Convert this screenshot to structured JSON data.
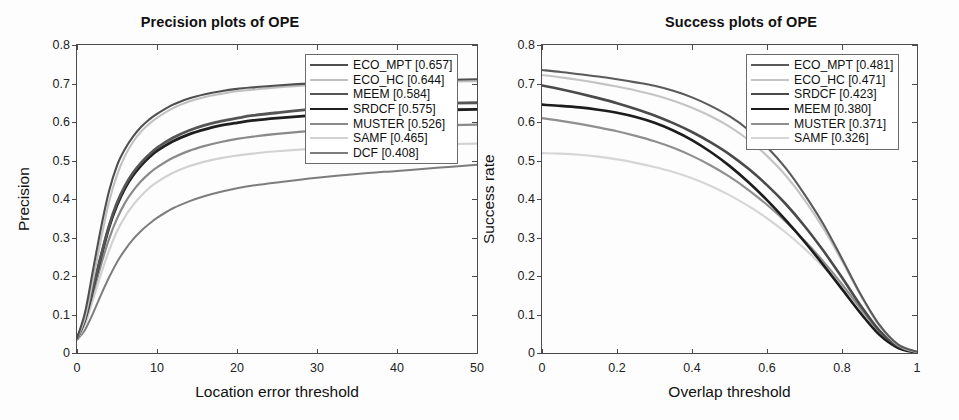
{
  "figure": {
    "background": "#fdfdfd",
    "panels": [
      "precision",
      "success"
    ]
  },
  "chart_data": [
    {
      "id": "precision",
      "type": "line",
      "title": "Precision plots of OPE",
      "xlabel": "Location error threshold",
      "ylabel": "Precision",
      "xlim": [
        0,
        50
      ],
      "ylim": [
        0,
        0.8
      ],
      "xticks": [
        0,
        10,
        20,
        30,
        40,
        50
      ],
      "xticklabels": [
        "0",
        "10",
        "20",
        "30",
        "40",
        "50"
      ],
      "yticks": [
        0,
        0.1,
        0.2,
        0.3,
        0.4,
        0.5,
        0.6,
        0.7,
        0.8
      ],
      "yticklabels": [
        "0",
        "0.1",
        "0.2",
        "0.3",
        "0.4",
        "0.5",
        "0.6",
        "0.7",
        "0.8"
      ],
      "grid": false,
      "legend_position": "upper right",
      "x": [
        0,
        1,
        2,
        3,
        4,
        5,
        6,
        7,
        8,
        9,
        10,
        12,
        14,
        16,
        18,
        20,
        22,
        25,
        30,
        35,
        40,
        45,
        50
      ],
      "series": [
        {
          "name": "ECO_MPT",
          "score": 0.657,
          "label": "ECO_MPT [0.657]",
          "color": "#4f4f4f",
          "width": 2.1,
          "values": [
            0.038,
            0.105,
            0.215,
            0.325,
            0.42,
            0.487,
            0.53,
            0.562,
            0.587,
            0.606,
            0.621,
            0.645,
            0.661,
            0.672,
            0.68,
            0.686,
            0.69,
            0.695,
            0.701,
            0.705,
            0.707,
            0.709,
            0.711
          ]
        },
        {
          "name": "ECO_HC",
          "score": 0.644,
          "label": "ECO_HC [0.644]",
          "color": "#c0c0c0",
          "width": 2.1,
          "values": [
            0.036,
            0.092,
            0.19,
            0.296,
            0.392,
            0.462,
            0.512,
            0.548,
            0.575,
            0.595,
            0.611,
            0.636,
            0.653,
            0.665,
            0.673,
            0.68,
            0.684,
            0.69,
            0.696,
            0.7,
            0.703,
            0.705,
            0.706
          ]
        },
        {
          "name": "MEEM",
          "score": 0.584,
          "label": "MEEM [0.584]",
          "color": "#555555",
          "width": 2.8,
          "values": [
            0.038,
            0.09,
            0.17,
            0.253,
            0.33,
            0.39,
            0.434,
            0.468,
            0.494,
            0.515,
            0.533,
            0.559,
            0.578,
            0.592,
            0.602,
            0.61,
            0.617,
            0.624,
            0.634,
            0.641,
            0.645,
            0.648,
            0.65
          ]
        },
        {
          "name": "SRDCF",
          "score": 0.575,
          "label": "SRDCF [0.575]",
          "color": "#1f1f1f",
          "width": 2.8,
          "values": [
            0.037,
            0.088,
            0.168,
            0.25,
            0.326,
            0.384,
            0.428,
            0.461,
            0.487,
            0.508,
            0.525,
            0.55,
            0.568,
            0.581,
            0.591,
            0.598,
            0.604,
            0.61,
            0.618,
            0.624,
            0.628,
            0.631,
            0.633
          ]
        },
        {
          "name": "MUSTER",
          "score": 0.526,
          "label": "MUSTER [0.526]",
          "color": "#8a8a8a",
          "width": 2.2,
          "values": [
            0.037,
            0.082,
            0.155,
            0.229,
            0.296,
            0.349,
            0.39,
            0.421,
            0.446,
            0.466,
            0.482,
            0.507,
            0.525,
            0.538,
            0.548,
            0.556,
            0.562,
            0.569,
            0.578,
            0.584,
            0.588,
            0.591,
            0.593
          ]
        },
        {
          "name": "SAMF",
          "score": 0.465,
          "label": "SAMF [0.465]",
          "color": "#d2d2d2",
          "width": 2.2,
          "values": [
            0.035,
            0.074,
            0.138,
            0.205,
            0.266,
            0.316,
            0.354,
            0.384,
            0.408,
            0.428,
            0.444,
            0.468,
            0.485,
            0.497,
            0.506,
            0.513,
            0.518,
            0.524,
            0.531,
            0.536,
            0.539,
            0.542,
            0.544
          ]
        },
        {
          "name": "DCF",
          "score": 0.408,
          "label": "DCF [0.408]",
          "color": "#7d7d7d",
          "width": 2.0,
          "values": [
            0.034,
            0.06,
            0.103,
            0.151,
            0.196,
            0.236,
            0.268,
            0.295,
            0.317,
            0.335,
            0.351,
            0.376,
            0.394,
            0.408,
            0.419,
            0.428,
            0.435,
            0.443,
            0.455,
            0.465,
            0.473,
            0.481,
            0.489
          ]
        }
      ]
    },
    {
      "id": "success",
      "type": "line",
      "title": "Success plots of OPE",
      "xlabel": "Overlap threshold",
      "ylabel": "Success rate",
      "xlim": [
        0,
        1
      ],
      "ylim": [
        0,
        0.8
      ],
      "xticks": [
        0,
        0.2,
        0.4,
        0.6,
        0.8,
        1
      ],
      "xticklabels": [
        "0",
        "0.2",
        "0.4",
        "0.6",
        "0.8",
        "1"
      ],
      "yticks": [
        0,
        0.1,
        0.2,
        0.3,
        0.4,
        0.5,
        0.6,
        0.7,
        0.8
      ],
      "yticklabels": [
        "0",
        "0.1",
        "0.2",
        "0.3",
        "0.4",
        "0.5",
        "0.6",
        "0.7",
        "0.8"
      ],
      "grid": false,
      "legend_position": "upper right",
      "x": [
        0,
        0.05,
        0.1,
        0.15,
        0.2,
        0.25,
        0.3,
        0.35,
        0.4,
        0.45,
        0.5,
        0.55,
        0.6,
        0.65,
        0.7,
        0.75,
        0.8,
        0.85,
        0.9,
        0.95,
        1
      ],
      "series": [
        {
          "name": "ECO_MPT",
          "score": 0.481,
          "label": "ECO_MPT [0.481]",
          "color": "#5a5a5a",
          "width": 2.1,
          "values": [
            0.735,
            0.73,
            0.724,
            0.718,
            0.711,
            0.703,
            0.694,
            0.681,
            0.664,
            0.642,
            0.615,
            0.58,
            0.535,
            0.48,
            0.412,
            0.335,
            0.245,
            0.152,
            0.073,
            0.022,
            0.003
          ]
        },
        {
          "name": "ECO_HC",
          "score": 0.471,
          "label": "ECO_HC [0.471]",
          "color": "#c4c4c4",
          "width": 2.1,
          "values": [
            0.722,
            0.716,
            0.709,
            0.701,
            0.692,
            0.682,
            0.67,
            0.655,
            0.637,
            0.615,
            0.588,
            0.554,
            0.512,
            0.461,
            0.398,
            0.324,
            0.239,
            0.149,
            0.07,
            0.02,
            0.002
          ]
        },
        {
          "name": "SRDCF",
          "score": 0.423,
          "label": "SRDCF [0.423]",
          "color": "#4a4a4a",
          "width": 2.6,
          "values": [
            0.695,
            0.685,
            0.674,
            0.662,
            0.649,
            0.634,
            0.617,
            0.597,
            0.574,
            0.547,
            0.516,
            0.479,
            0.436,
            0.387,
            0.33,
            0.266,
            0.196,
            0.123,
            0.058,
            0.017,
            0.002
          ]
        },
        {
          "name": "MEEM",
          "score": 0.38,
          "label": "MEEM [0.380]",
          "color": "#1c1c1c",
          "width": 2.6,
          "values": [
            0.645,
            0.642,
            0.638,
            0.632,
            0.624,
            0.613,
            0.598,
            0.578,
            0.553,
            0.522,
            0.486,
            0.444,
            0.397,
            0.345,
            0.289,
            0.229,
            0.166,
            0.103,
            0.047,
            0.013,
            0.001
          ]
        },
        {
          "name": "MUSTER",
          "score": 0.371,
          "label": "MUSTER [0.371]",
          "color": "#8f8f8f",
          "width": 2.2,
          "values": [
            0.61,
            0.603,
            0.595,
            0.586,
            0.576,
            0.564,
            0.55,
            0.533,
            0.512,
            0.487,
            0.458,
            0.424,
            0.385,
            0.341,
            0.292,
            0.238,
            0.179,
            0.115,
            0.055,
            0.016,
            0.002
          ]
        },
        {
          "name": "SAMF",
          "score": 0.326,
          "label": "SAMF [0.326]",
          "color": "#d6d6d6",
          "width": 2.2,
          "values": [
            0.519,
            0.518,
            0.515,
            0.51,
            0.503,
            0.494,
            0.483,
            0.47,
            0.454,
            0.434,
            0.41,
            0.382,
            0.35,
            0.313,
            0.271,
            0.224,
            0.172,
            0.114,
            0.056,
            0.016,
            0.002
          ]
        }
      ]
    }
  ]
}
